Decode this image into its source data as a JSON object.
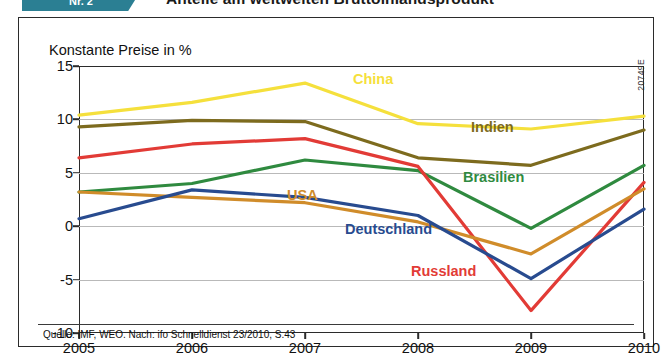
{
  "header": {
    "badge_label": "Nr. 2",
    "headline": "Anteile am weltweiten Bruttoinlandsprodukt",
    "badge_color": "#2b7f93"
  },
  "figure": {
    "axis_title": "Konstante Preise in %",
    "side_code": "20749E",
    "source": "Quelle: IMF, WEO. Nach: ifo Schnelldienst 23/2010, S.43"
  },
  "chart_data": {
    "type": "line",
    "title": "Anteile am weltweiten Bruttoinlandsprodukt",
    "subtitle": "Konstante Preise in %",
    "xlabel": "",
    "ylabel": "Konstante Preise in %",
    "x": [
      "2005",
      "2006",
      "2007",
      "2008",
      "2009",
      "2010"
    ],
    "xticklabels": [
      "2005",
      "2006",
      "2007",
      "2008",
      "2009",
      "2010"
    ],
    "yticklabels": [
      "15",
      "10",
      "5",
      "0",
      "-5",
      "-10"
    ],
    "yticks": [
      15,
      10,
      5,
      0,
      -5,
      -10
    ],
    "ylim": [
      -10,
      15
    ],
    "grid": "horizontal",
    "legend": "inline-labels",
    "series": [
      {
        "name": "China",
        "color": "#f5e03c",
        "values": [
          10.4,
          11.6,
          13.4,
          9.6,
          9.1,
          10.3
        ],
        "label_x": 352,
        "label_y": 70
      },
      {
        "name": "Indien",
        "color": "#7d6b1e",
        "values": [
          9.3,
          9.9,
          9.8,
          6.4,
          5.7,
          9.0
        ],
        "label_x": 470,
        "label_y": 118
      },
      {
        "name": "Brasilien",
        "color": "#2f8a3f",
        "values": [
          3.2,
          4.0,
          6.2,
          5.2,
          -0.2,
          5.7
        ],
        "label_x": 462,
        "label_y": 168
      },
      {
        "name": "Russland",
        "color": "#e23b36",
        "values": [
          6.4,
          7.7,
          8.2,
          5.6,
          -7.9,
          4.1
        ],
        "label_x": 410,
        "label_y": 262
      },
      {
        "name": "USA",
        "color": "#d08c2a",
        "values": [
          3.2,
          2.7,
          2.2,
          0.4,
          -2.6,
          3.5
        ],
        "label_x": 286,
        "label_y": 186
      },
      {
        "name": "Deutschland",
        "color": "#284b8f",
        "values": [
          0.7,
          3.4,
          2.7,
          1.0,
          -4.9,
          1.6
        ],
        "label_x": 344,
        "label_y": 220
      }
    ]
  }
}
